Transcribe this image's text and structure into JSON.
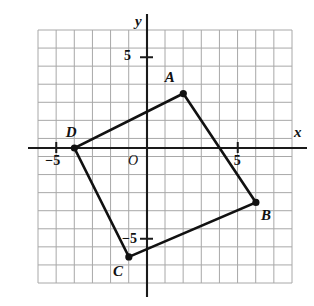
{
  "figure": {
    "kind": "coordinate-plane-quadrilateral",
    "background_color": "#ffffff",
    "grid_color": "#a8a8a8",
    "axis_color": "#1a1a1a",
    "shape_color": "#111111",
    "axis_labels": {
      "x": "x",
      "y": "y"
    },
    "origin_label": "O",
    "tick_labels": {
      "x_positive": "5",
      "x_negative": "−5",
      "y_positive": "5",
      "y_negative": "−5"
    }
  },
  "chart_data": {
    "type": "scatter",
    "title": "",
    "xlabel": "x",
    "ylabel": "y",
    "xlim": [
      -7,
      7
    ],
    "ylim": [
      -7,
      7
    ],
    "grid": true,
    "legend": "none",
    "x_ticks": [
      -5,
      5
    ],
    "y_ticks": [
      -5,
      5
    ],
    "x_tick_labels": [
      "−5",
      "5"
    ],
    "y_tick_labels": [
      "−5",
      "5"
    ],
    "annotations": [
      "O"
    ],
    "series": [
      {
        "name": "quadrilateral ABCD",
        "closed": true,
        "points": [
          {
            "label": "A",
            "x": 2,
            "y": 3,
            "label_dx": -0.75,
            "label_dy": 0.85
          },
          {
            "label": "B",
            "x": 6,
            "y": -3,
            "label_dx": 0.55,
            "label_dy": -0.75
          },
          {
            "label": "C",
            "x": -1,
            "y": -6,
            "label_dx": -0.6,
            "label_dy": -0.85
          },
          {
            "label": "D",
            "x": -4,
            "y": 0,
            "label_dx": -0.2,
            "label_dy": 0.85
          }
        ]
      }
    ]
  }
}
